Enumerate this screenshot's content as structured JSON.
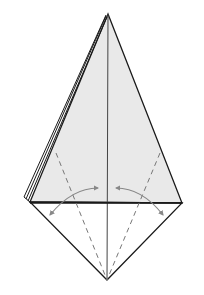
{
  "diagram": {
    "type": "origami-fold-step",
    "colors": {
      "background": "#ffffff",
      "paper_fill": "#e9e9e9",
      "outline": "#1a1a1a",
      "crease": "#555555",
      "dashed_guide": "#777777",
      "arrow": "#888888"
    },
    "shapes": {
      "kite_top": "108,14 30,202 182,203",
      "bottom_triangle": "30,202 182,203 107,280",
      "layer_edges": [
        "106,15 24,197",
        "106,16 26,199",
        "107,17 28,201"
      ],
      "center_crease": {
        "x1": 108,
        "y1": 14,
        "x2": 107,
        "y2": 280
      },
      "horizontal_edge": {
        "x1": 30,
        "y1": 203,
        "x2": 182,
        "y2": 203
      },
      "dashed_left": {
        "x1": 56,
        "y1": 153,
        "x2": 107,
        "y2": 280
      },
      "dashed_right": {
        "x1": 160,
        "y1": 153,
        "x2": 107,
        "y2": 280
      },
      "arrow_left": "M 50 215 Q 72 188 98 188",
      "arrow_right": "M 116 188 Q 142 188 163 215"
    }
  }
}
